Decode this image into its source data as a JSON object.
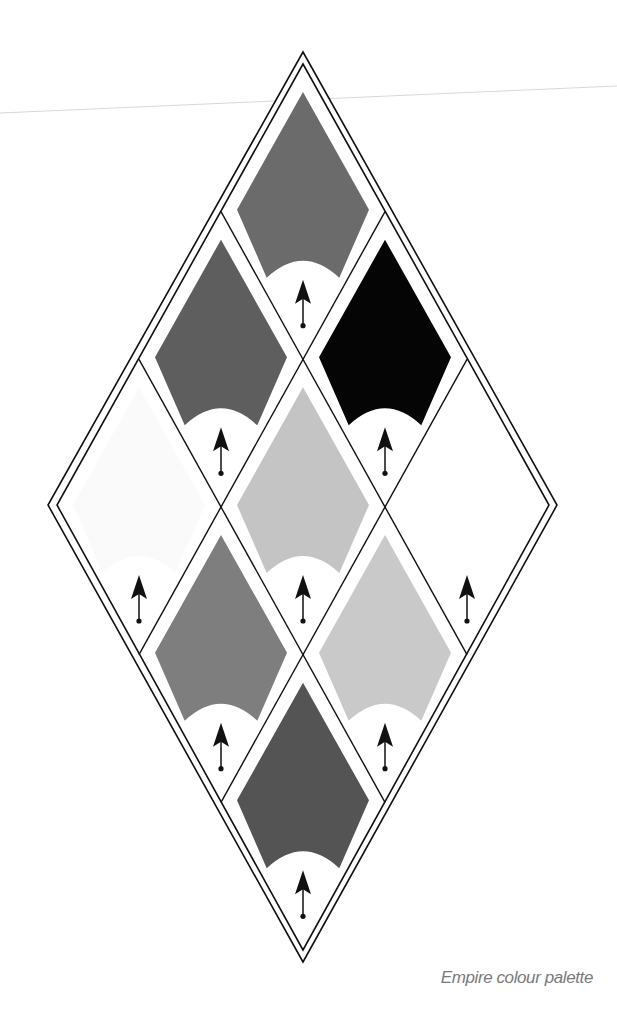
{
  "caption": "Empire colour palette",
  "diagram": {
    "type": "diamond-lattice-palette",
    "grid": "3x3 diamond cells within double-outlined outer diamond",
    "outer_outline_color": "#111111",
    "arrow_icon": "upward-arrow-with-dot",
    "cells": [
      {
        "position": "top",
        "row": 0,
        "col": 0,
        "fill": "#6b6b6b"
      },
      {
        "position": "upper-left",
        "row": 1,
        "col": 0,
        "fill": "#5e5e5e"
      },
      {
        "position": "upper-right",
        "row": 0,
        "col": 1,
        "fill": "#050505"
      },
      {
        "position": "left",
        "row": 2,
        "col": 0,
        "fill": "#fafafa"
      },
      {
        "position": "center",
        "row": 1,
        "col": 1,
        "fill": "#c4c4c4"
      },
      {
        "position": "right",
        "row": 0,
        "col": 2,
        "fill": "#ffffff"
      },
      {
        "position": "lower-left",
        "row": 2,
        "col": 1,
        "fill": "#7e7e7e"
      },
      {
        "position": "lower-right",
        "row": 1,
        "col": 2,
        "fill": "#c9c9c9"
      },
      {
        "position": "bottom",
        "row": 2,
        "col": 2,
        "fill": "#545454"
      }
    ]
  }
}
